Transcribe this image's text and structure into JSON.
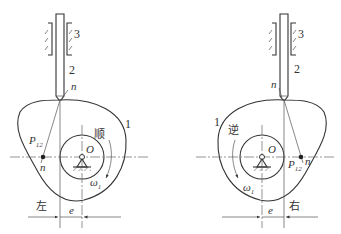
{
  "diagrams": [
    {
      "id": "left",
      "rotation_label": "顺",
      "side_label": "左",
      "part_labels": {
        "cam": "1",
        "follower": "2",
        "guide": "3"
      },
      "normal_label": "n",
      "normal_label_bottom": "n",
      "center_label": "O",
      "instant_center_label": "P",
      "instant_center_sub": "12",
      "omega_label": "ω",
      "omega_sub": "1",
      "offset_label": "e"
    },
    {
      "id": "right",
      "rotation_label": "逆",
      "side_label": "右",
      "part_labels": {
        "cam": "1",
        "follower": "2",
        "guide": "3"
      },
      "normal_label": "n",
      "normal_label_bottom": "n",
      "center_label": "O",
      "instant_center_label": "P",
      "instant_center_sub": "12",
      "omega_label": "ω",
      "omega_sub": "1",
      "offset_label": "e"
    }
  ],
  "colors": {
    "line": "#333333",
    "background": "#ffffff"
  }
}
